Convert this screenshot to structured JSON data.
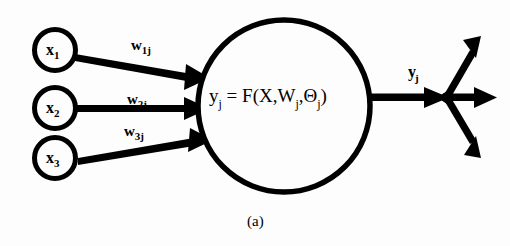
{
  "figure": {
    "caption": "(a)",
    "background_color": "#fdfdfd",
    "ink_color": "#000000"
  },
  "inputs": [
    {
      "id": "x1",
      "label": "x",
      "subscript": "1",
      "shape": "circle",
      "cx": 55,
      "cy": 50,
      "r": 21
    },
    {
      "id": "x2",
      "label": "x",
      "subscript": "2",
      "shape": "circle",
      "cx": 55,
      "cy": 108,
      "r": 21
    },
    {
      "id": "x3",
      "label": "x",
      "subscript": "3",
      "shape": "circle",
      "cx": 55,
      "cy": 158,
      "r": 21
    }
  ],
  "weights": [
    {
      "id": "w1j",
      "label": "w",
      "subscript": "1j",
      "from": "x1",
      "to": "neuron"
    },
    {
      "id": "w2j",
      "label": "w",
      "subscript": "2j",
      "from": "x2",
      "to": "neuron"
    },
    {
      "id": "w3j",
      "label": "w",
      "subscript": "3j",
      "from": "x3",
      "to": "neuron"
    }
  ],
  "neuron": {
    "shape": "circle",
    "cx": 284,
    "cy": 106,
    "r": 88,
    "formula": {
      "lhs": "y",
      "lhs_subscript": "j",
      "equals": "=",
      "function": "F",
      "args": [
        "X",
        "W",
        "Θ"
      ],
      "arg_subscripts": [
        "",
        "j",
        "j"
      ],
      "full_text": "y_j = F(X,W_j,Θ_j)"
    }
  },
  "output": {
    "label": "y",
    "subscript": "j",
    "fanout_point": {
      "x": 443,
      "y": 97
    },
    "branches": [
      {
        "id": "branch-up",
        "direction": "up-right",
        "tip_x": 477,
        "tip_y": 41
      },
      {
        "id": "branch-right",
        "direction": "right",
        "tip_x": 494,
        "tip_y": 97
      },
      {
        "id": "branch-down",
        "direction": "down-right",
        "tip_x": 477,
        "tip_y": 150
      }
    ]
  }
}
